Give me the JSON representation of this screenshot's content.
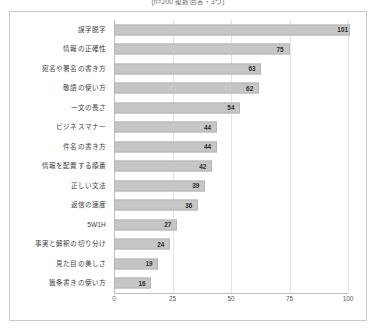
{
  "header": {
    "note": "(n=200 複数回答・3つ)"
  },
  "chart_data": {
    "type": "bar",
    "orientation": "horizontal",
    "title": "(n=200 複数回答・3つ)",
    "subtitle": "",
    "xlabel": "",
    "ylabel": "",
    "xlim": [
      0,
      100
    ],
    "xticks": [
      0,
      25,
      50,
      75,
      100
    ],
    "xtick_labels": [
      "0",
      "25",
      "50",
      "75",
      "100"
    ],
    "grid": true,
    "grid_axis": "x",
    "legend": false,
    "bar_color": "#c6c6c6",
    "bar_edge_color": "#b5b5b5",
    "label_color": "#2b2b2b",
    "categories": [
      "誤字脱字",
      "情報の正確性",
      "宛名や署名の書き方",
      "敬語の使い方",
      "一文の長さ",
      "ビジネスマナー",
      "件名の書き方",
      "情報を配置する順番",
      "正しい文法",
      "返信の速度",
      "5W1H",
      "事実と解釈の切り分け",
      "見た目の美しさ",
      "箇条書きの使い方"
    ],
    "values": [
      101,
      75,
      63,
      62,
      54,
      44,
      44,
      42,
      39,
      36,
      27,
      24,
      19,
      16
    ],
    "value_labels": [
      "101",
      "75",
      "63",
      "62",
      "54",
      "44",
      "44",
      "42",
      "39",
      "36",
      "27",
      "24",
      "19",
      "16"
    ]
  }
}
